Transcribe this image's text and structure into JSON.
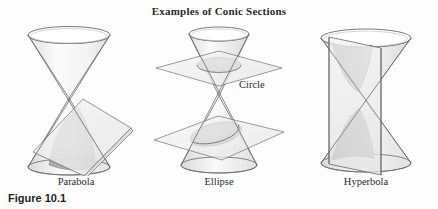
{
  "figure": {
    "title": "Examples of Conic Sections",
    "number": "Figure 10.1",
    "callout_circle": "Circle",
    "panels": [
      {
        "id": "parabola",
        "caption": "Parabola",
        "conic": "parabola",
        "description": "double cone cut by a tilted plane parallel to one generator"
      },
      {
        "id": "ellipse",
        "caption": "Ellipse",
        "conic": "ellipse",
        "description": "double cone cut by a horizontal plane giving a circle and an oblique plane giving an ellipse"
      },
      {
        "id": "hyperbola",
        "caption": "Hyperbola",
        "conic": "hyperbola",
        "description": "double cone cut by a vertical plane meeting both nappes"
      }
    ]
  },
  "colors": {
    "background": "#fdfdfd",
    "outline": "#5d5d5d",
    "cone_light": "#f4f4f4",
    "cone_mid": "#e3e3e3",
    "plane_fill": "#ededed",
    "section_shade": "#b8b8b8",
    "section_dark": "#9a9a9a",
    "text": "#2b2b2b"
  }
}
